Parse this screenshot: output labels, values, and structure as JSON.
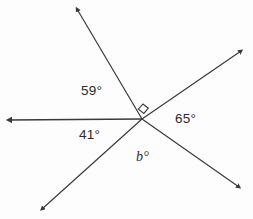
{
  "diagram": {
    "background_color": "#fdfdfd",
    "line_color": "#3a3a3a",
    "text_color": "#2b2b2b",
    "vertex": {
      "x": 142,
      "y": 119
    },
    "rays": [
      {
        "name": "ray-left",
        "tip_x": 5,
        "tip_y": 120,
        "arrow": true
      },
      {
        "name": "ray-upper-left",
        "tip_x": 74,
        "tip_y": 5,
        "arrow": true
      },
      {
        "name": "ray-upper-right",
        "tip_x": 245,
        "tip_y": 48,
        "arrow": true
      },
      {
        "name": "ray-lower-right",
        "tip_x": 243,
        "tip_y": 190,
        "arrow": true
      },
      {
        "name": "ray-lower-left",
        "tip_x": 38,
        "tip_y": 212,
        "arrow": true
      }
    ],
    "right_angle_marker": {
      "name": "right-angle-square",
      "value": "90",
      "between": [
        "ray-upper-left",
        "ray-upper-right"
      ]
    },
    "labels": {
      "angle_59": "59°",
      "angle_41": "41°",
      "angle_65": "65°",
      "angle_b": "b°"
    }
  }
}
